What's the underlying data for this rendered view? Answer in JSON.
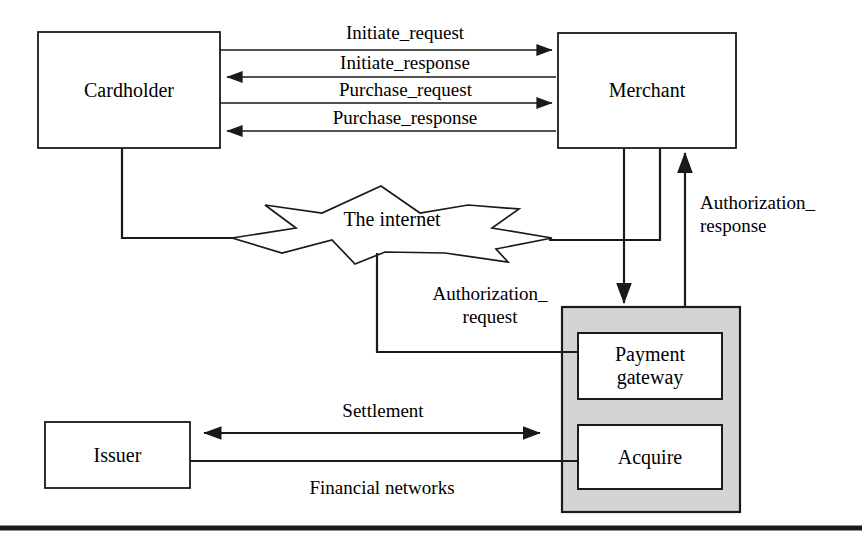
{
  "diagram": {
    "colors": {
      "stroke": "#1a1a1a",
      "background": "#ffffff",
      "container_fill": "#d4d4d4",
      "node_fill": "#ffffff"
    },
    "nodes": [
      {
        "id": "cardholder",
        "label": "Cardholder",
        "x": 38,
        "y": 32,
        "w": 182,
        "h": 116
      },
      {
        "id": "merchant",
        "label": "Merchant",
        "x": 558,
        "y": 33,
        "w": 178,
        "h": 115
      },
      {
        "id": "internet",
        "label": "The internet",
        "x": 232,
        "y": 186,
        "w": 320,
        "h": 70
      },
      {
        "id": "gateway-group",
        "label": "",
        "x": 562,
        "y": 307,
        "w": 178,
        "h": 205
      },
      {
        "id": "payment-gateway",
        "label": "Payment\ngateway",
        "x": 578,
        "y": 333,
        "w": 144,
        "h": 66
      },
      {
        "id": "acquire",
        "label": "Acquire",
        "x": 578,
        "y": 425,
        "w": 144,
        "h": 64
      },
      {
        "id": "issuer",
        "label": "Issuer",
        "x": 45,
        "y": 422,
        "w": 145,
        "h": 66
      }
    ],
    "edge_labels": [
      {
        "id": "initiate-request",
        "text": "Initiate_request",
        "x": 310,
        "y": 22,
        "w": 190
      },
      {
        "id": "initiate-response",
        "text": "Initiate_response",
        "x": 305,
        "y": 54,
        "w": 200
      },
      {
        "id": "purchase-request",
        "text": "Purchase_request",
        "x": 303,
        "y": 86,
        "w": 205
      },
      {
        "id": "purchase-response",
        "text": "Purchase_response",
        "x": 300,
        "y": 113,
        "w": 210
      },
      {
        "id": "authorization-response",
        "text": "Authorization_\nresponse",
        "x": 700,
        "y": 196,
        "w": 150
      },
      {
        "id": "authorization-request",
        "text": "Authorization_\nrequest",
        "x": 420,
        "y": 287,
        "w": 140
      },
      {
        "id": "settlement",
        "text": "Settlement",
        "x": 318,
        "y": 402,
        "w": 130
      },
      {
        "id": "financial-networks",
        "text": "Financial networks",
        "x": 282,
        "y": 480,
        "w": 200
      }
    ]
  }
}
